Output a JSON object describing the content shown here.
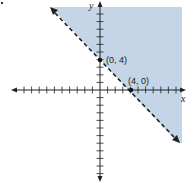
{
  "chart_data": {
    "type": "scatter",
    "title": "",
    "xlabel": "x",
    "ylabel": "y",
    "xlim": [
      -11,
      11
    ],
    "ylim": [
      -12,
      11
    ],
    "grid": false,
    "boundary_line": {
      "equation": "y = -x + 4",
      "style": "dashed",
      "inequality": "x + y > 4"
    },
    "points": [
      {
        "label": "(0, 4)",
        "x": 0,
        "y": 4
      },
      {
        "label": "(4, 0)",
        "x": 4,
        "y": 0
      }
    ],
    "shaded_region": "above-right of boundary",
    "colors": {
      "shade": "#c3d5e7",
      "axis": "#222222",
      "line": "#222222"
    }
  },
  "labels": {
    "x_axis": "x",
    "y_axis": "y",
    "point_a": "(0, 4)",
    "point_b": "(4, 0)"
  },
  "layout": {
    "origin_px": [
      100,
      90
    ],
    "unit_px": 7.6
  }
}
